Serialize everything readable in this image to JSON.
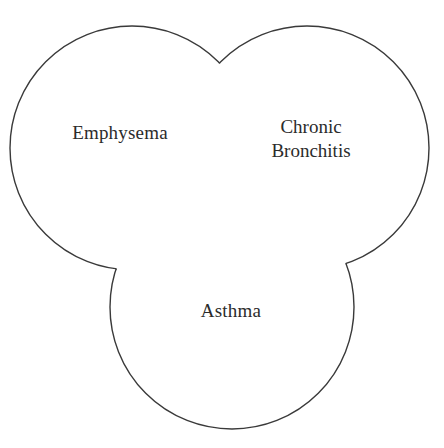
{
  "figure": {
    "type": "venn-diagram",
    "name": "three-circle-venn-diagram",
    "background_color": "#ffffff",
    "stroke_color": "#3a3a3a",
    "stroke_width": 1.4,
    "text_color": "#2b2b2b",
    "width": 444,
    "height": 448
  },
  "sets": [
    {
      "id": "emphysema",
      "label": "Emphysema",
      "label_lines": [
        "Emphysema"
      ],
      "cx": 132,
      "cy": 148,
      "r": 122,
      "label_x": 120,
      "label_y": 135
    },
    {
      "id": "chronic-bronchitis",
      "label": "Chronic Bronchitis",
      "label_lines": [
        "Chronic",
        "Bronchitis"
      ],
      "cx": 307,
      "cy": 148,
      "r": 122,
      "label_x": 311,
      "label_y": 135
    },
    {
      "id": "asthma",
      "label": "Asthma",
      "label_lines": [
        "Asthma"
      ],
      "cx": 232,
      "cy": 307,
      "r": 122,
      "label_x": 231,
      "label_y": 313
    }
  ],
  "labels": {
    "emphysema": "Emphysema",
    "chronic_line1": "Chronic",
    "chronic_line2": "Bronchitis",
    "asthma": "Asthma"
  }
}
